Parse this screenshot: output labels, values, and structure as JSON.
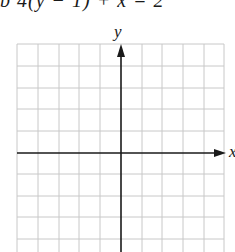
{
  "problem": {
    "equation_text": "b  4(y − 1) + x = 2"
  },
  "graph": {
    "x_axis_label": "x",
    "y_axis_label": "y",
    "grid_columns": 10,
    "grid_rows_visible": 10,
    "grid_color": "#c8c8c8",
    "axis_color": "#1a1a1a"
  }
}
